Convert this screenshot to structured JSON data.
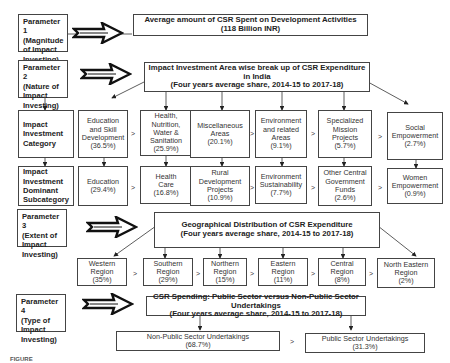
{
  "parameters": [
    {
      "label": "Parameter 1",
      "line2": "(Magnitude",
      "line3": "of Impact",
      "line4": "Investing)"
    },
    {
      "label": "Parameter 2",
      "line2": "(Nature of",
      "line3": "Impact",
      "line4": "Investing)"
    },
    {
      "label": "Parameter 3",
      "line2": "(Extent of",
      "line3": "Impact",
      "line4": "Investing)"
    },
    {
      "label": "Parameter 4",
      "line2": "(Type of",
      "line3": "Impact",
      "line4": "Investing)"
    }
  ],
  "row_labels": {
    "category": {
      "l1": "Impact",
      "l2": "Investment",
      "l3": "Category"
    },
    "subcategory": {
      "l1": "Impact",
      "l2": "Investment",
      "l3": "Dominant",
      "l4": "Subcategory"
    }
  },
  "titles": {
    "p1": {
      "l1": "Average amount of CSR Spent on Development Activities",
      "l2": "(118 Billion INR)"
    },
    "p2": {
      "l1": "Impact Investment Area wise break up of CSR Expenditure in India",
      "l2": "(Four years average share, 2014-15 to 2017-18)"
    },
    "p3": {
      "l1": "Geographical Distribution of CSR Expenditure",
      "l2": "(Four years average share, 2014-15 to 2017-18)"
    },
    "p4": {
      "l1": "CSR Spending: Public Sector versus Non-Public Sector Undertakings",
      "l2": "(Four years average share, 2014-15 to 2017-18)"
    }
  },
  "categories": [
    {
      "lines": [
        "Education",
        "and Skill",
        "Development"
      ],
      "value": "(36.5%)"
    },
    {
      "lines": [
        "Health,",
        "Nutrition,",
        "Water &",
        "Sanitation"
      ],
      "value": "(25.9%)"
    },
    {
      "lines": [
        "Miscellaneous",
        "Areas"
      ],
      "value": "(20.1%)"
    },
    {
      "lines": [
        "Environment",
        "and related",
        "Areas"
      ],
      "value": "(9.1%)"
    },
    {
      "lines": [
        "Specialized",
        "Mission",
        "Projects"
      ],
      "value": "(5.7%)"
    },
    {
      "lines": [
        "Social",
        "Empowerment"
      ],
      "value": "(2.7%)"
    }
  ],
  "subcategories": [
    {
      "lines": [
        "Education"
      ],
      "value": "(29.4%)"
    },
    {
      "lines": [
        "Health",
        "Care"
      ],
      "value": "(16.8%)"
    },
    {
      "lines": [
        "Rural",
        "Development",
        "Projects"
      ],
      "value": "(10.9%)"
    },
    {
      "lines": [
        "Environment",
        "Sustainability"
      ],
      "value": "(7.7%)"
    },
    {
      "lines": [
        "Other Central",
        "Government",
        "Funds"
      ],
      "value": "(2.6%)"
    },
    {
      "lines": [
        "Women",
        "Empowerment"
      ],
      "value": "(0.9%)"
    }
  ],
  "regions": [
    {
      "lines": [
        "Western",
        "Region"
      ],
      "value": "(35%)"
    },
    {
      "lines": [
        "Southern",
        "Region"
      ],
      "value": "(29%)"
    },
    {
      "lines": [
        "Northern",
        "Region"
      ],
      "value": "(15%)"
    },
    {
      "lines": [
        "Eastern",
        "Region"
      ],
      "value": "(11%)"
    },
    {
      "lines": [
        "Central",
        "Region"
      ],
      "value": "(8%)"
    },
    {
      "lines": [
        "North Eastern",
        "Region"
      ],
      "value": "(2%)"
    }
  ],
  "sectors": [
    {
      "lines": [
        "Non-Public Sector Undertakings"
      ],
      "value": "(68.7%)"
    },
    {
      "lines": [
        "Public Sector Undertakings"
      ],
      "value": "(31.3%)"
    }
  ],
  "comparator": ">",
  "caption": "FIGURE"
}
